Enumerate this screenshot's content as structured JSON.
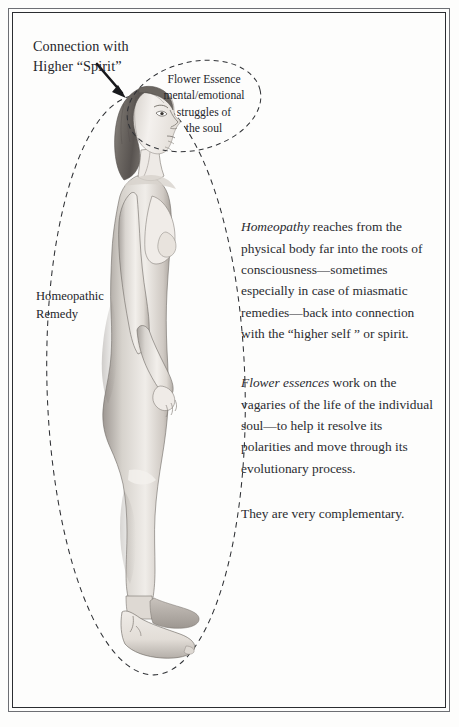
{
  "page": {
    "background_color": "#fdfdfc",
    "frame_outer_color": "#6d6f74",
    "frame_inner_color": "#2b2d31",
    "ink_color": "#24252a"
  },
  "callouts": {
    "spirit": {
      "text": "Connection with\nHigher “Spirit”",
      "arrow": "arrow-to-head"
    },
    "flower_essence": {
      "text": "Flower Essence\nmental/emotional\nstruggles of\nthe soul"
    },
    "homeopathic_remedy": {
      "text": "Homeopathic\nRemedy"
    }
  },
  "illustration": {
    "subject": "standing-female-nude-profile",
    "large_aura_ellipse": "homeopathic-remedy-field",
    "small_aura_ellipse": "flower-essence-field"
  },
  "body_text": {
    "paragraph_1": {
      "lead_italic": "Homeopathy",
      "rest": " reaches from the physical body far into the roots of consciousness—sometimes especially in case of miasmatic remedies—back into connection with the “higher self ” or spirit."
    },
    "paragraph_2": {
      "lead_italic": "Flower essences",
      "rest": " work on the vagaries of the life of the individual soul—to help it resolve its polarities and move through its evolutionary process."
    },
    "paragraph_3": {
      "lead_italic": "",
      "rest": "They are very complementary."
    }
  }
}
